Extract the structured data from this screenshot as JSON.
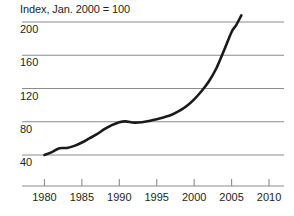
{
  "chart_data": {
    "type": "line",
    "title": "Index, Jan. 2000 = 100",
    "xlabel": "",
    "ylabel": "",
    "xlim": [
      1977,
      2012
    ],
    "ylim": [
      27,
      213
    ],
    "grid": true,
    "legend": null,
    "y_ticks": [
      200,
      160,
      120,
      80,
      40
    ],
    "y_tick_labels": [
      "200",
      "160",
      "120",
      "80",
      "40"
    ],
    "x_ticks": [
      1980,
      1985,
      1990,
      1995,
      2000,
      2005,
      2010
    ],
    "x_tick_labels": [
      "1980",
      "1985",
      "1990",
      "1995",
      "2000",
      "2005",
      "2010"
    ],
    "series": [
      {
        "name": "Index",
        "color": "#1a1a1a",
        "x": [
          1980.0,
          1981.0,
          1982.0,
          1983.0,
          1984.0,
          1985.0,
          1986.0,
          1987.0,
          1988.0,
          1989.0,
          1990.0,
          1990.8,
          1992.0,
          1993.0,
          1994.0,
          1995.0,
          1996.0,
          1997.0,
          1998.0,
          1999.0,
          2000.0,
          2001.0,
          2002.0,
          2003.0,
          2004.0,
          2005.0,
          2005.6,
          2006.3
        ],
        "y": [
          40.0,
          43.5,
          48.0,
          48.5,
          51.0,
          55.0,
          60.0,
          65.0,
          71.0,
          76.0,
          79.5,
          80.5,
          79.0,
          79.5,
          81.0,
          83.0,
          85.5,
          88.5,
          93.0,
          99.0,
          107.0,
          117.0,
          129.0,
          145.0,
          166.0,
          188.0,
          196.0,
          208.0
        ]
      }
    ]
  },
  "colors": {
    "grid": "#8c8c8c",
    "axis": "#8c8c8c",
    "line": "#1a1a1a",
    "text": "#231f20",
    "background": "#ffffff"
  }
}
